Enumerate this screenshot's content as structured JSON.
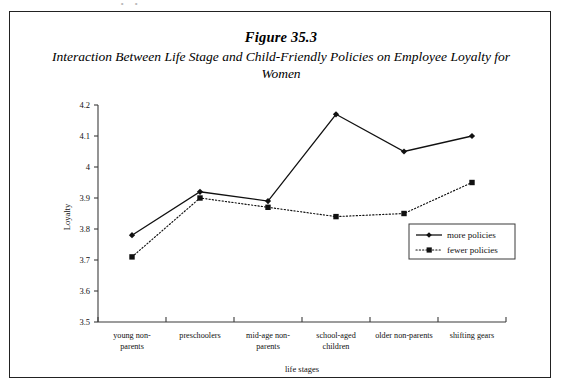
{
  "figure": {
    "number_label": "Figure 35.3",
    "title": "Interaction Between Life Stage and Child-Friendly Policies on Employee Loyalty for Women",
    "scan_artifact": "∘ ∘"
  },
  "chart_data": {
    "type": "line",
    "title": "Interaction Between Life Stage and Child-Friendly Policies on Employee Loyalty for Women",
    "xlabel": "life stages",
    "ylabel": "Loyalty",
    "categories": [
      "young non-parents",
      "preschoolers",
      "mid-age non-parents",
      "school-aged children",
      "older non-parents",
      "shifting gears"
    ],
    "category_lines": [
      [
        "young non-",
        "parents"
      ],
      [
        "preschoolers"
      ],
      [
        "mid-age non-",
        "parents"
      ],
      [
        "school-aged",
        "children"
      ],
      [
        "older non-parents"
      ],
      [
        "shifting gears"
      ]
    ],
    "series": [
      {
        "name": "more policies",
        "values": [
          3.78,
          3.92,
          3.89,
          4.17,
          4.05,
          4.1
        ],
        "style": "solid",
        "marker": "diamond"
      },
      {
        "name": "fewer policies",
        "values": [
          3.71,
          3.9,
          3.87,
          3.84,
          3.85,
          3.95
        ],
        "style": "dotted",
        "marker": "square"
      }
    ],
    "ylim": [
      3.5,
      4.2
    ],
    "ytick_labels": [
      "4.2",
      "4.1",
      "4",
      "3.9",
      "3.8",
      "3.7",
      "3.6",
      "3.5"
    ],
    "ytick_values": [
      4.2,
      4.1,
      4.0,
      3.9,
      3.8,
      3.7,
      3.6,
      3.5
    ],
    "grid": false,
    "legend_position": "center-right",
    "legend_entries": [
      "more policies",
      "fewer policies"
    ]
  },
  "colors": {
    "line": "#111111",
    "axis": "#3b3b3b",
    "frame": "#222222",
    "background": "#ffffff"
  }
}
